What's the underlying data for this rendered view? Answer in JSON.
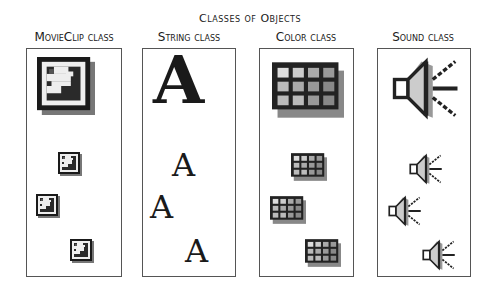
{
  "title": "Classes of Objects",
  "columns": [
    {
      "label": "MovieClip class",
      "icon": "movieclip-icon",
      "instances": 3
    },
    {
      "label": "String class",
      "icon": "letter-a-icon",
      "instances": 3
    },
    {
      "label": "Color class",
      "icon": "color-grid-icon",
      "instances": 3
    },
    {
      "label": "Sound class",
      "icon": "speaker-icon",
      "instances": 3
    }
  ],
  "colors": {
    "border": "#555555",
    "dark": "#1a1a1a",
    "shadow": "#777777"
  }
}
